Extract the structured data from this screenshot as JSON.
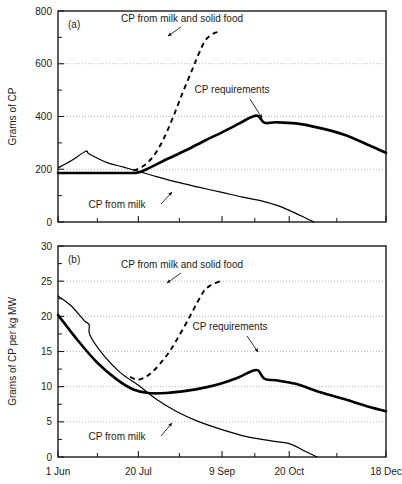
{
  "figure": {
    "width": 402,
    "height": 484,
    "background": "#ffffff",
    "ink_color": "#000000",
    "grid_color": "#999999"
  },
  "chart_data": [
    {
      "id": "panel-a",
      "type": "line",
      "panel_label": "(a)",
      "title": "",
      "xlabel": "",
      "ylabel": "Grams of CP",
      "xlim": [
        0,
        200
      ],
      "ylim": [
        0,
        800
      ],
      "grid": true,
      "grid_axis": "y",
      "legend_position": "inline-annotations",
      "x_tick_labels": [
        "1 Jun",
        "20 Jul",
        "9 Sep",
        "20 Oct",
        "18 Dec"
      ],
      "x_tick_values": [
        0,
        49,
        100,
        141,
        200
      ],
      "x_minor_tick_values": [
        24,
        74,
        120,
        170
      ],
      "y_tick_labels": [
        "0",
        "200",
        "400",
        "600",
        "800"
      ],
      "y_tick_values": [
        0,
        200,
        400,
        600,
        800
      ],
      "y_minor_tick_values": [
        100,
        300,
        500,
        700
      ],
      "series": [
        {
          "name": "CP from milk",
          "style": "thin-solid",
          "x": [
            0,
            8,
            17,
            19,
            30,
            40,
            49,
            60,
            72,
            85,
            100,
            112,
            124,
            134,
            141,
            150,
            156
          ],
          "y": [
            205,
            232,
            268,
            258,
            225,
            208,
            192,
            172,
            152,
            133,
            112,
            95,
            80,
            62,
            44,
            18,
            0
          ]
        },
        {
          "name": "CP requirements",
          "style": "bold-solid",
          "x": [
            0,
            20,
            40,
            49,
            56,
            65,
            78,
            90,
            100,
            110,
            118,
            122,
            126,
            133,
            145,
            160,
            175,
            190,
            200
          ],
          "y": [
            186,
            186,
            186,
            188,
            206,
            234,
            272,
            310,
            340,
            372,
            398,
            402,
            376,
            378,
            374,
            356,
            330,
            290,
            262
          ]
        },
        {
          "name": "CP from milk and solid food",
          "style": "dashed",
          "x": [
            46,
            52,
            58,
            64,
            70,
            76,
            82,
            86,
            90,
            95,
            99
          ],
          "y": [
            195,
            212,
            248,
            310,
            395,
            490,
            580,
            640,
            690,
            715,
            722
          ]
        }
      ],
      "annotations": [
        {
          "text": "CP from milk and solid food",
          "x_px": 182,
          "y_px": 22
        },
        {
          "text": "CP requirements",
          "x_px": 232,
          "y_px": 93
        },
        {
          "text": "CP from milk",
          "x_px": 117,
          "y_px": 208
        }
      ]
    },
    {
      "id": "panel-b",
      "type": "line",
      "panel_label": "(b)",
      "title": "",
      "xlabel": "",
      "ylabel": "Grams of CP per kg MW",
      "xlim": [
        0,
        200
      ],
      "ylim": [
        0,
        30
      ],
      "grid": true,
      "grid_axis": "y",
      "legend_position": "inline-annotations",
      "x_tick_labels": [
        "1 Jun",
        "20 Jul",
        "9 Sep",
        "20 Oct",
        "18 Dec"
      ],
      "x_tick_values": [
        0,
        49,
        100,
        141,
        200
      ],
      "x_minor_tick_values": [
        24,
        74,
        120,
        170
      ],
      "y_tick_labels": [
        "0",
        "5",
        "10",
        "15",
        "20",
        "25",
        "30"
      ],
      "y_tick_values": [
        0,
        5,
        10,
        15,
        20,
        25,
        30
      ],
      "y_minor_tick_values": [
        2.5,
        7.5,
        12.5,
        17.5,
        22.5,
        27.5
      ],
      "series": [
        {
          "name": "CP from milk",
          "style": "thin-solid",
          "x": [
            0,
            8,
            16,
            19,
            19.5,
            28,
            38,
            49,
            60,
            72,
            85,
            100,
            115,
            130,
            141,
            150,
            158
          ],
          "y": [
            22.9,
            21.5,
            19.4,
            18.8,
            17.3,
            14.4,
            12.0,
            10.2,
            8.2,
            6.5,
            5.1,
            3.9,
            2.9,
            2.3,
            1.9,
            0.9,
            0.0
          ]
        },
        {
          "name": "CP requirements",
          "style": "bold-solid",
          "x": [
            0,
            12,
            24,
            36,
            46,
            55,
            66,
            78,
            90,
            100,
            110,
            118,
            122,
            126,
            133,
            145,
            160,
            175,
            190,
            200
          ],
          "y": [
            20.2,
            16.6,
            13.4,
            11.0,
            9.6,
            9.1,
            9.1,
            9.4,
            9.9,
            10.5,
            11.3,
            12.2,
            12.3,
            11.1,
            10.9,
            10.4,
            9.2,
            8.2,
            7.1,
            6.5
          ]
        },
        {
          "name": "CP from milk and solid food",
          "style": "dashed",
          "x": [
            44,
            48,
            52,
            57,
            62,
            68,
            74,
            80,
            85,
            89,
            93,
            99
          ],
          "y": [
            11.4,
            11.0,
            11.2,
            12.0,
            13.2,
            15.0,
            17.3,
            19.8,
            22.0,
            23.6,
            24.4,
            25.0
          ]
        }
      ],
      "annotations": [
        {
          "text": "CP from milk and solid food",
          "x_px": 182,
          "y_px": 268
        },
        {
          "text": "CP requirements",
          "x_px": 230,
          "y_px": 330
        },
        {
          "text": "CP from milk",
          "x_px": 117,
          "y_px": 440
        }
      ]
    }
  ]
}
